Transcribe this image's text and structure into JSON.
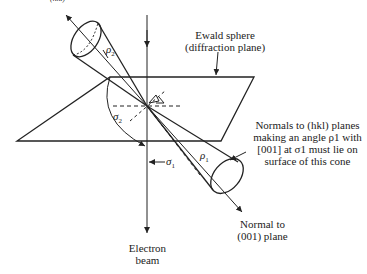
{
  "diagram": {
    "top_fragment": "(hkl)",
    "labels": {
      "ewald_line1": "Ewald sphere",
      "ewald_line2": "(diffraction plane)",
      "normals_line1": "Normals to (hkl) planes",
      "normals_line2": "making an angle ρ1 with",
      "normals_line3": "[001] at σ1 must lie on",
      "normals_line4": "surface of this cone",
      "normal001_line1": "Normal to",
      "normal001_line2": "(001) plane",
      "beam_line1": "Electron",
      "beam_line2": "beam"
    },
    "symbols": {
      "rho2": "ρ",
      "rho2_sub": "2",
      "sigma2": "σ",
      "sigma2_sub": "2",
      "sigma1": "σ",
      "sigma1_sub": "1",
      "rho1": "ρ",
      "rho1_sub": "1"
    },
    "colors": {
      "ink": "#222222",
      "background": "#ffffff"
    }
  }
}
